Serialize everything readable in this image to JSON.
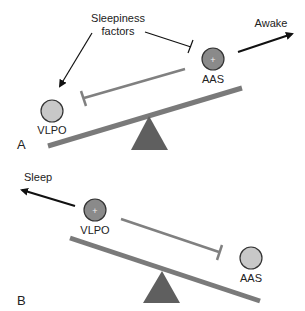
{
  "panels": {
    "a": {
      "label": "A",
      "sleepiness_line1": "Sleepiness",
      "sleepiness_line2": "factors",
      "awake": "Awake",
      "vlpo": "VLPO",
      "aas": "AAS",
      "active_marker": "+"
    },
    "b": {
      "label": "B",
      "sleep": "Sleep",
      "vlpo": "VLPO",
      "aas": "AAS",
      "active_marker": "+"
    }
  },
  "colors": {
    "bar": "#7a7a7a",
    "fulcrum": "#5f5f5f",
    "inactive_node": "#c8c8c8",
    "active_node": "#8a8a8a",
    "arrow": "#111111",
    "inhibit": "#808080"
  }
}
